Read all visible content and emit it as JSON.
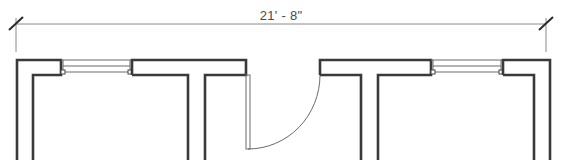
{
  "drawing": {
    "type": "floor-plan-detail",
    "dimension": {
      "label": "21' - 8\"",
      "x_start": 16,
      "x_end": 546,
      "y": 24
    },
    "colors": {
      "wall": "#3a3a3a",
      "thin_line": "#6a6a6a",
      "dimension_line": "#8a8a8a",
      "text": "#4a4a4a",
      "background": "#ffffff"
    },
    "elements": [
      {
        "kind": "wall",
        "label": "left-corner-wall"
      },
      {
        "kind": "window",
        "label": "left-window"
      },
      {
        "kind": "wall",
        "label": "left-t-wall"
      },
      {
        "kind": "door",
        "label": "swing-door",
        "swing": "arc"
      },
      {
        "kind": "wall",
        "label": "right-t-wall"
      },
      {
        "kind": "window",
        "label": "right-window"
      },
      {
        "kind": "wall",
        "label": "right-corner-wall"
      }
    ]
  }
}
